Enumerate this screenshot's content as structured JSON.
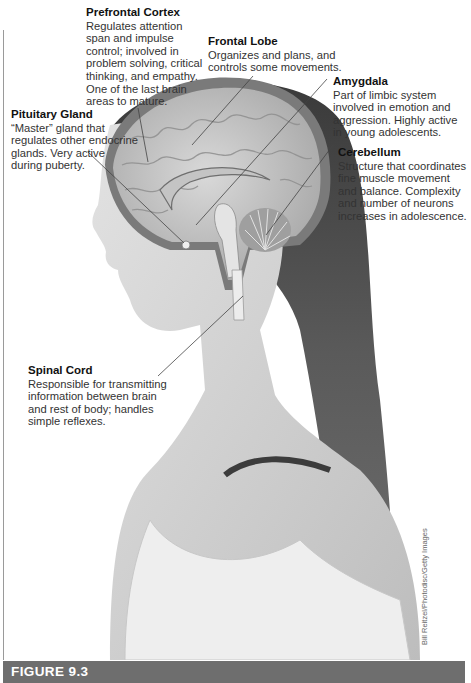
{
  "figure": {
    "caption_label": "FIGURE 9.3",
    "photo_credit": "Bill Reitzel/Photodisc/Getty Images",
    "colors": {
      "footer_bar": "#6e6e6e",
      "footer_text": "#ffffff",
      "label_title": "#111111",
      "label_text": "#333333",
      "leader_line": "#444444",
      "border": "#9a9a9a"
    }
  },
  "labels": [
    {
      "id": "prefrontal-cortex",
      "title": "Prefrontal Cortex",
      "description": "Regulates attention\nspan and impulse\ncontrol; involved in\nproblem solving, critical\nthinking, and empathy.\nOne of the last brain\nareas to mature."
    },
    {
      "id": "frontal-lobe",
      "title": "Frontal Lobe",
      "description": "Organizes and plans, and\ncontrols some movements."
    },
    {
      "id": "amygdala",
      "title": "Amygdala",
      "description": "Part of limbic system\ninvolved in emotion and\naggression. Highly active\nin young adolescents."
    },
    {
      "id": "pituitary-gland",
      "title": "Pituitary Gland",
      "description": "“Master” gland that\nregulates other endocrine\nglands. Very active\nduring puberty."
    },
    {
      "id": "cerebellum",
      "title": "Cerebellum",
      "description": "Structure that coordinates\nfine muscle movement\nand balance. Complexity\nand number of neurons\nincreases in adolescence."
    },
    {
      "id": "spinal-cord",
      "title": "Spinal Cord",
      "description": "Responsible for transmitting\ninformation between brain\nand rest of body; handles\nsimple reflexes."
    }
  ]
}
